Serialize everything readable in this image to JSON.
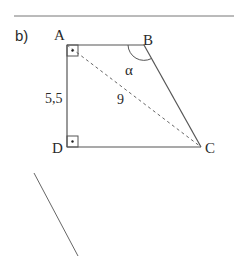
{
  "task_label": "b)",
  "figure": {
    "type": "right trapezoid",
    "vertices": {
      "A": {
        "label": "A",
        "x": 67,
        "y": 45
      },
      "B": {
        "label": "B",
        "x": 144,
        "y": 45
      },
      "C": {
        "label": "C",
        "x": 201,
        "y": 147
      },
      "D": {
        "label": "D",
        "x": 67,
        "y": 147
      }
    },
    "right_angles": [
      "A",
      "D"
    ],
    "side_labels": {
      "AD": "5,5"
    },
    "diagonal": {
      "from": "A",
      "to": "C",
      "style": "dashed",
      "label": "9"
    },
    "angle": {
      "at": "B",
      "label": "α"
    }
  },
  "extra_line": {
    "from": {
      "x": 34,
      "y": 173
    },
    "to": {
      "x": 78,
      "y": 256
    }
  },
  "colors": {
    "stroke": "#555555",
    "text": "#2a2a2a",
    "background": "#ffffff"
  }
}
